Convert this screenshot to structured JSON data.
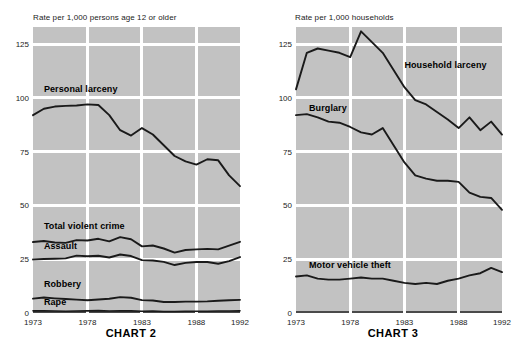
{
  "top_fragment": "",
  "charts": [
    {
      "id": "chart-2",
      "title": "CHART 2",
      "axis_caption": "Rate per 1,000 persons age 12 or older",
      "chart_data": {
        "type": "line",
        "title": "CHART 2",
        "xlabel": "",
        "ylabel": "Rate per 1,000 persons age 12 or older",
        "xlim": [
          1973,
          1992
        ],
        "ylim": [
          0,
          133
        ],
        "yticks": [
          0,
          25,
          50,
          75,
          100,
          125
        ],
        "xticks": [
          1973,
          1978,
          1983,
          1988,
          1992
        ],
        "grid": true,
        "legend": "inline-labels",
        "x": [
          1973,
          1974,
          1975,
          1976,
          1977,
          1978,
          1979,
          1980,
          1981,
          1982,
          1983,
          1984,
          1985,
          1986,
          1987,
          1988,
          1989,
          1990,
          1991,
          1992
        ],
        "series": [
          {
            "name": "Personal larceny",
            "values": [
              92.0,
              95.0,
              96.0,
              96.3,
              96.5,
              97.0,
              96.7,
              92.0,
              85.0,
              82.5,
              86.0,
              83.0,
              78.0,
              73.0,
              70.5,
              69.0,
              71.5,
              71.0,
              64.0,
              59.0
            ]
          },
          {
            "name": "Total violent crime",
            "values": [
              33.0,
              33.5,
              32.8,
              32.6,
              33.9,
              33.7,
              34.5,
              33.3,
              35.3,
              34.3,
              31.0,
              31.4,
              30.0,
              28.1,
              29.3,
              29.6,
              29.8,
              29.6,
              31.3,
              33.1
            ]
          },
          {
            "name": "Assault",
            "values": [
              24.9,
              25.1,
              25.2,
              25.4,
              26.7,
              26.4,
              26.6,
              25.8,
              27.2,
              26.5,
              24.6,
              24.4,
              23.8,
              22.3,
              23.3,
              23.7,
              23.7,
              22.9,
              24.1,
              26.0
            ]
          },
          {
            "name": "Robbery",
            "values": [
              6.7,
              7.2,
              6.8,
              6.5,
              6.2,
              5.9,
              6.3,
              6.6,
              7.4,
              7.1,
              6.0,
              5.8,
              5.1,
              5.1,
              5.3,
              5.3,
              5.4,
              5.7,
              5.9,
              6.1
            ]
          },
          {
            "name": "Rape",
            "values": [
              1.0,
              1.0,
              0.9,
              0.8,
              0.9,
              1.0,
              1.1,
              0.9,
              1.0,
              1.0,
              0.8,
              0.9,
              0.7,
              0.7,
              0.8,
              0.8,
              0.8,
              0.9,
              0.9,
              1.0
            ]
          }
        ]
      }
    },
    {
      "id": "chart-3",
      "title": "CHART 3",
      "axis_caption": "Rate per 1,000 households",
      "chart_data": {
        "type": "line",
        "title": "CHART 3",
        "xlabel": "",
        "ylabel": "Rate per 1,000 households",
        "xlim": [
          1973,
          1992
        ],
        "ylim": [
          0,
          133
        ],
        "yticks": [
          0,
          25,
          50,
          75,
          100,
          125
        ],
        "xticks": [
          1973,
          1978,
          1983,
          1988,
          1992
        ],
        "grid": true,
        "legend": "inline-labels",
        "x": [
          1973,
          1974,
          1975,
          1976,
          1977,
          1978,
          1979,
          1980,
          1981,
          1982,
          1983,
          1984,
          1985,
          1986,
          1987,
          1988,
          1989,
          1990,
          1991,
          1992
        ],
        "series": [
          {
            "name": "Household larceny",
            "values": [
              104.0,
              121.0,
              123.0,
              122.0,
              121.0,
              119.0,
              131.0,
              126.0,
              121.0,
              113.0,
              105.0,
              99.0,
              97.0,
              93.5,
              90.0,
              86.0,
              91.0,
              85.0,
              89.0,
              83.0
            ]
          },
          {
            "name": "Burglary",
            "values": [
              92.0,
              92.5,
              91.0,
              89.0,
              88.5,
              86.5,
              84.0,
              83.0,
              86.0,
              78.0,
              70.0,
              64.0,
              62.5,
              61.5,
              61.5,
              61.0,
              56.0,
              54.0,
              53.5,
              48.0
            ]
          },
          {
            "name": "Motor vehicle theft",
            "values": [
              17.0,
              17.5,
              16.0,
              15.5,
              15.5,
              16.0,
              16.5,
              16.0,
              16.0,
              15.0,
              14.0,
              13.5,
              14.0,
              13.5,
              15.0,
              16.0,
              17.5,
              18.5,
              21.0,
              19.0
            ]
          }
        ]
      }
    }
  ]
}
